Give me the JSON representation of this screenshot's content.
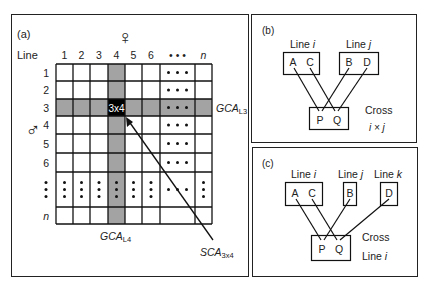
{
  "panel_a": {
    "label": "(a)",
    "line_label": "Line",
    "female_symbol": "♀",
    "male_symbol": "♂",
    "col_headers": [
      "1",
      "2",
      "3",
      "4",
      "5",
      "6",
      "• • •",
      "n"
    ],
    "row_headers": [
      "1",
      "2",
      "3",
      "4",
      "5",
      "6",
      "⋮",
      "n"
    ],
    "highlight_row": 3,
    "highlight_col": 4,
    "cross_cell_label": "3x4",
    "gca_row_label": "GCA",
    "gca_row_sub": "L3",
    "gca_col_label": "GCA",
    "gca_col_sub": "L4",
    "sca_label": "SCA",
    "sca_sub": "3x4",
    "colors": {
      "highlight": "#a3a3a3",
      "cross_cell": "#000000",
      "grid": "#111111"
    }
  },
  "panel_b": {
    "label": "(b)",
    "line_i": "Line ",
    "line_i_var": "i",
    "line_j": "Line ",
    "line_j_var": "j",
    "box_i": [
      "A",
      "C"
    ],
    "box_j": [
      "B",
      "D"
    ],
    "cross_box": [
      "P",
      "Q"
    ],
    "cross_label": "Cross",
    "cross_sub": "i × j"
  },
  "panel_c": {
    "label": "(c)",
    "line_i": "Line ",
    "line_i_var": "i",
    "line_j": "Line ",
    "line_j_var": "j",
    "line_k": "Line ",
    "line_k_var": "k",
    "box_i": [
      "A",
      "C"
    ],
    "box_j": [
      "B"
    ],
    "box_k": [
      "D"
    ],
    "cross_box": [
      "P",
      "Q"
    ],
    "cross_label": "Cross",
    "cross_sub_text": "Line ",
    "cross_sub_var": "i"
  }
}
